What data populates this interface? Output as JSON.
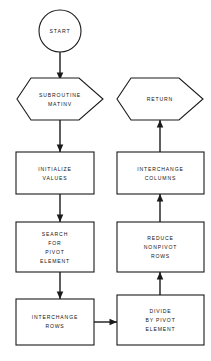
{
  "diagram": {
    "background_color": "#ffffff",
    "line_color": "#1a1a1a",
    "text_color": "#141414"
  },
  "nodes": {
    "start": {
      "shape": "circle",
      "label": "START",
      "lines": [
        "START"
      ]
    },
    "subroutine": {
      "shape": "hexagon",
      "label": "SUBROUTINE MATINV",
      "lines": [
        "SUBROUTINE",
        "MATINV"
      ]
    },
    "return": {
      "shape": "hexagon",
      "label": "RETURN",
      "lines": [
        "RETURN"
      ]
    },
    "initialize": {
      "shape": "rectangle",
      "label": "INITIALIZE VALUES",
      "lines": [
        "INITIALIZE",
        "VALUES"
      ]
    },
    "interchange_columns": {
      "shape": "rectangle",
      "label": "INTERCHANGE COLUMNS",
      "lines": [
        "INTERCHANGE",
        "COLUMNS"
      ]
    },
    "search_pivot": {
      "shape": "rectangle",
      "label": "SEARCH FOR PIVOT ELEMENT",
      "lines": [
        "SEARCH",
        "FOR",
        "PIVOT",
        "ELEMENT"
      ]
    },
    "reduce_nonpivot": {
      "shape": "rectangle",
      "label": "REDUCE NONPIVOT ROWS",
      "lines": [
        "REDUCE",
        "NONPIVOT",
        "ROWS"
      ]
    },
    "interchange_rows": {
      "shape": "rectangle",
      "label": "INTERCHANGE ROWS",
      "lines": [
        "INTERCHANGE",
        "ROWS"
      ]
    },
    "divide_pivot": {
      "shape": "rectangle",
      "label": "DIVIDE BY PIVOT ELEMENT",
      "lines": [
        "DIVIDE",
        "BY PIVOT",
        "ELEMENT"
      ]
    }
  },
  "edges": [
    {
      "from": "start",
      "to": "subroutine",
      "direction": "down"
    },
    {
      "from": "subroutine",
      "to": "initialize",
      "direction": "down"
    },
    {
      "from": "initialize",
      "to": "search_pivot",
      "direction": "down"
    },
    {
      "from": "search_pivot",
      "to": "interchange_rows",
      "direction": "down"
    },
    {
      "from": "interchange_rows",
      "to": "divide_pivot",
      "direction": "right"
    },
    {
      "from": "divide_pivot",
      "to": "reduce_nonpivot",
      "direction": "up"
    },
    {
      "from": "reduce_nonpivot",
      "to": "interchange_columns",
      "direction": "up"
    },
    {
      "from": "interchange_columns",
      "to": "return",
      "direction": "up"
    }
  ]
}
